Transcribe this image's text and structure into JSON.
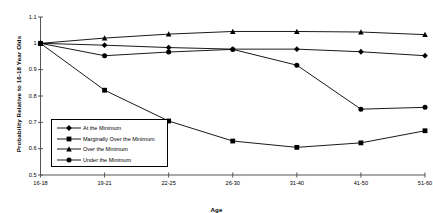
{
  "chart_data": {
    "type": "line",
    "title": "",
    "xlabel": "Age",
    "ylabel": "Probability Relative to 16-18 Year Olds",
    "categories": [
      "16-18",
      "19-21",
      "22-25",
      "26-30",
      "31-40",
      "41-50",
      "51-60"
    ],
    "ylim": [
      0.5,
      1.1
    ],
    "yticks": [
      "0.5",
      "0.6",
      "0.7",
      "0.8",
      "0.9",
      "1",
      "1.1"
    ],
    "ytick_values": [
      0.5,
      0.6,
      0.7,
      0.8,
      0.9,
      1.0,
      1.1
    ],
    "grid": false,
    "legend_position": "inside-lower-left",
    "series": [
      {
        "name": "At the Minimum",
        "marker": "diamond",
        "color": "#000000",
        "values": [
          1.0,
          0.993,
          0.984,
          0.978,
          0.978,
          0.968,
          0.953
        ]
      },
      {
        "name": "Marginally Over the Minimum",
        "marker": "square",
        "color": "#000000",
        "values": [
          1.0,
          0.822,
          0.705,
          0.629,
          0.605,
          0.622,
          0.668
        ]
      },
      {
        "name": "Over the Minimum",
        "marker": "triangle",
        "color": "#000000",
        "values": [
          1.0,
          1.02,
          1.035,
          1.045,
          1.045,
          1.043,
          1.033
        ]
      },
      {
        "name": "Under the Minimum",
        "marker": "circle",
        "color": "#000000",
        "values": [
          1.0,
          0.953,
          0.967,
          0.977,
          0.917,
          0.75,
          0.757
        ]
      }
    ]
  },
  "legend": {
    "items": [
      {
        "label": "At the Minimum",
        "marker": "diamond"
      },
      {
        "label": "Marginally Over the Minimum",
        "marker": "square"
      },
      {
        "label": "Over the Minimum",
        "marker": "triangle"
      },
      {
        "label": "Under the Minimum",
        "marker": "circle"
      }
    ]
  },
  "axes": {
    "x_title": "Age",
    "y_title": "Probability Relative to 16-18 Year Olds"
  }
}
